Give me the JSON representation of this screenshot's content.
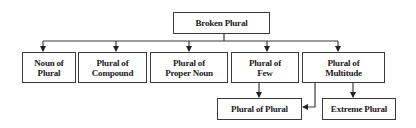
{
  "diagram": {
    "type": "tree",
    "root": {
      "id": "broken",
      "label": "Broken Plural"
    },
    "level2": [
      {
        "id": "noun-of-plural",
        "label": "Noun of\nPlural"
      },
      {
        "id": "plural-of-compound",
        "label": "Plural of\nCompound"
      },
      {
        "id": "plural-of-proper-noun",
        "label": "Plural of\nProper Noun"
      },
      {
        "id": "plural-of-few",
        "label": "Plural of\nFew"
      },
      {
        "id": "plural-of-multitude",
        "label": "Plural of\nMultitude"
      }
    ],
    "level3": [
      {
        "id": "plural-of-plural",
        "label": "Plural of Plural"
      },
      {
        "id": "extreme-plural",
        "label": "Extreme Plural"
      }
    ],
    "edges": [
      {
        "from": "broken",
        "to": "noun-of-plural"
      },
      {
        "from": "broken",
        "to": "plural-of-compound"
      },
      {
        "from": "broken",
        "to": "plural-of-proper-noun"
      },
      {
        "from": "broken",
        "to": "plural-of-few"
      },
      {
        "from": "broken",
        "to": "plural-of-multitude"
      },
      {
        "from": "plural-of-few",
        "to": "plural-of-plural"
      },
      {
        "from": "plural-of-multitude",
        "to": "plural-of-plural"
      },
      {
        "from": "plural-of-multitude",
        "to": "extreme-plural"
      }
    ],
    "colors": {
      "line": "#3a3a3a",
      "box_fill": "#ffffff",
      "text": "#1a1a1a"
    }
  }
}
